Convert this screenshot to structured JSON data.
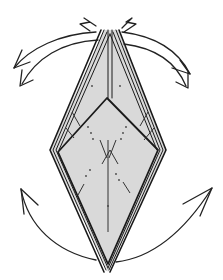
{
  "diagram": {
    "type": "origami-fold-step",
    "colors": {
      "paper_fill": "#d9d9d9",
      "outline": "#1a1a1a",
      "background": "#ffffff"
    },
    "arrows": [
      {
        "name": "top-left-outer-arrow",
        "direction": "down-left"
      },
      {
        "name": "top-left-inner-arrow",
        "direction": "down-left"
      },
      {
        "name": "top-right-outer-arrow",
        "direction": "down-right"
      },
      {
        "name": "top-right-inner-arrow",
        "direction": "down-right"
      },
      {
        "name": "bottom-left-arrow",
        "direction": "up-left"
      },
      {
        "name": "bottom-right-arrow",
        "direction": "up-right"
      }
    ]
  }
}
